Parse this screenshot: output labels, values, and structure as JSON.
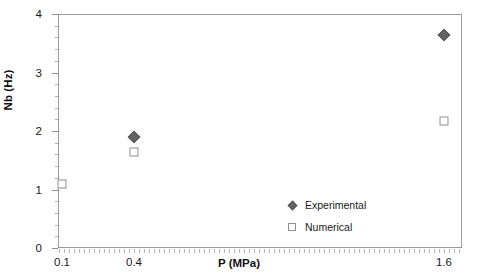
{
  "chart_data": {
    "type": "scatter",
    "title": "",
    "xlabel": "P (MPa)",
    "ylabel": "Nb (Hz)",
    "xticklabels": [
      "0.1",
      "0.4",
      "1.6"
    ],
    "xtickvalues": [
      0.1,
      0.4,
      1.6
    ],
    "yticklabels": [
      "0",
      "1",
      "2",
      "3",
      "4"
    ],
    "ytickvalues": [
      0,
      1,
      2,
      3,
      4
    ],
    "ylim": [
      0,
      4
    ],
    "grid": false,
    "legend_position": "inside-bottom-right",
    "series": [
      {
        "name": "Experimental",
        "marker": "filled-diamond",
        "color": "#636363",
        "points": [
          {
            "x": 0.4,
            "y": 1.9
          },
          {
            "x": 1.6,
            "y": 3.64
          }
        ]
      },
      {
        "name": "Numerical",
        "marker": "open-square",
        "color": "#8f8f8f",
        "points": [
          {
            "x": 0.1,
            "y": 1.09
          },
          {
            "x": 0.4,
            "y": 1.64
          },
          {
            "x": 1.6,
            "y": 2.17
          }
        ]
      }
    ]
  },
  "axes": {
    "y_labels": [
      "4",
      "3",
      "2",
      "1",
      "0"
    ],
    "x_labels": [
      "0.1",
      "0.4",
      "1.6"
    ],
    "x_title": "P (MPa)",
    "y_title": "Nb (Hz)"
  },
  "legend": {
    "items": [
      {
        "label": "Experimental",
        "marker": "filled-diamond"
      },
      {
        "label": "Numerical",
        "marker": "open-square"
      }
    ]
  }
}
